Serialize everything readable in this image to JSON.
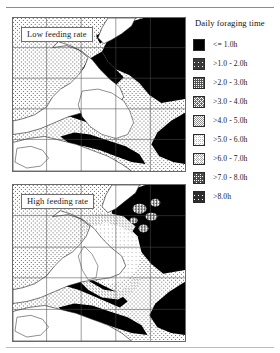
{
  "figure": {
    "kind": "two-panel shaded contour map with categorical legend"
  },
  "panels": [
    {
      "id": "low",
      "label": "Low feeding rate"
    },
    {
      "id": "high",
      "label": "High feeding rate"
    }
  ],
  "legend": {
    "title": "Daily foraging time",
    "items": [
      {
        "label": "<= 1.0h",
        "fill": "#000000",
        "density": 100
      },
      {
        "label": ">1.0 - 2.0h",
        "fill": "#3a3a3a",
        "density": 88
      },
      {
        "label": ">2.0 - 3.0h",
        "fill": "#565656",
        "density": 75
      },
      {
        "label": ">3.0 - 4.0h",
        "fill": "#6e6e6e",
        "density": 62
      },
      {
        "label": ">4.0 - 5.0h",
        "fill": "#909090",
        "density": 50
      },
      {
        "label": ">5.0 - 6.0h",
        "fill": "#c2c2c2",
        "density": 30
      },
      {
        "label": ">6.0 - 7.0h",
        "fill": "#a8a8a8",
        "density": 40
      },
      {
        "label": ">7.0 - 8.0h",
        "fill": "#4a4a4a",
        "density": 80
      },
      {
        "label": ">8.0h",
        "fill": "#2c2c2c",
        "density": 92
      }
    ]
  },
  "chart_data": {
    "type": "heatmap",
    "title": "Daily foraging time",
    "subtitle": "",
    "xlabel": "",
    "ylabel": "",
    "grid": true,
    "legend_position": "right",
    "categories": [
      "<= 1.0h",
      ">1.0 - 2.0h",
      ">2.0 - 3.0h",
      ">3.0 - 4.0h",
      ">4.0 - 5.0h",
      ">5.0 - 6.0h",
      ">6.0 - 7.0h",
      ">7.0 - 8.0h",
      ">8.0h"
    ],
    "category_colors": [
      "#000000",
      "#3a3a3a",
      "#565656",
      "#6e6e6e",
      "#909090",
      "#c2c2c2",
      "#a8a8a8",
      "#4a4a4a",
      "#2c2c2c"
    ],
    "panels": [
      {
        "name": "Low feeding rate",
        "dominant_category": ">4.0 - 5.0h",
        "offshore_category": "<= 1.0h",
        "grid_rows": 5,
        "grid_cols": 5,
        "description": "Shelf/coastal waters mostly mid-range (>4.0-5.0h); deep offshore water and estuary mouths shaded darkest (<= 1.0h)."
      },
      {
        "name": "High feeding rate",
        "dominant_category": ">4.0 - 5.0h",
        "offshore_category": "<= 1.0h",
        "nearshore_category": ">5.0 - 6.0h",
        "grid_rows": 5,
        "grid_cols": 5,
        "description": "Same shelf extent but a large light patch (>5.0-6.0h) appears in the central bay, with darker (>2.0-4.0h) fringes along the coastline."
      }
    ],
    "axis_ranges": {
      "x": [
        0,
        1
      ],
      "y": [
        0,
        1
      ]
    }
  }
}
